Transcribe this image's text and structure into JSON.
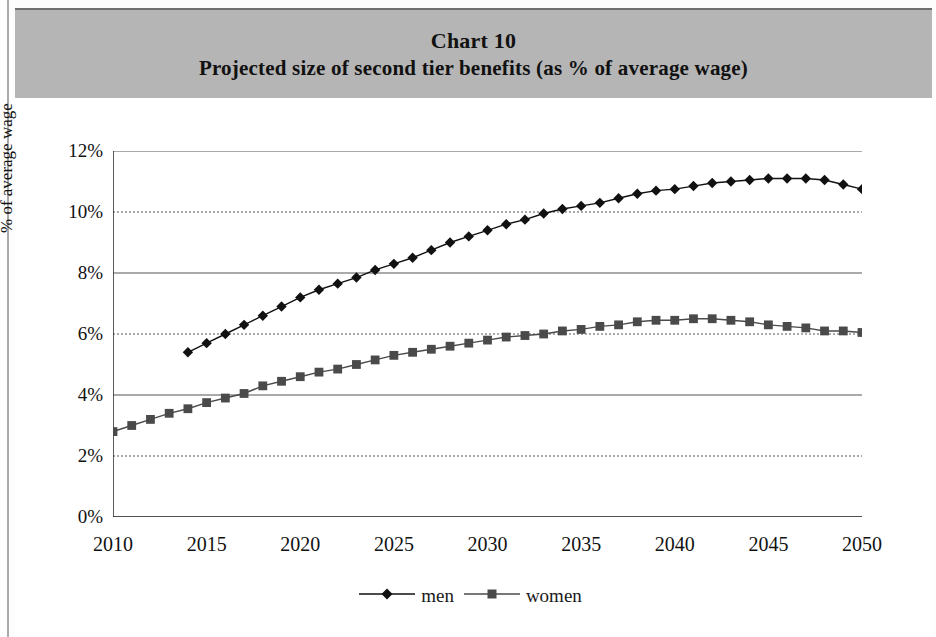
{
  "header": {
    "chart_number": "Chart 10",
    "subtitle": "Projected size of second tier benefits (as % of average wage)"
  },
  "legend": {
    "position": "bottom-center",
    "entries": [
      {
        "label": "men",
        "marker": "diamond",
        "color": "#111111"
      },
      {
        "label": "women",
        "marker": "square",
        "color": "#4a4a4a"
      }
    ]
  },
  "axes": {
    "y_title": "% of average wage",
    "y_ticks": [
      "0%",
      "2%",
      "4%",
      "6%",
      "8%",
      "10%",
      "12%"
    ],
    "x_ticks": [
      "2010",
      "2015",
      "2020",
      "2025",
      "2030",
      "2035",
      "2040",
      "2045",
      "2050"
    ]
  },
  "chart_data": {
    "type": "line",
    "title": "Chart 10",
    "subtitle": "Projected size of second tier benefits (as % of average wage)",
    "xlabel": "",
    "ylabel": "% of average wage",
    "xlim": [
      2010,
      2050
    ],
    "ylim": [
      0,
      12
    ],
    "y_tick_values": [
      0,
      2,
      4,
      6,
      8,
      10,
      12
    ],
    "y_tick_labels": [
      "0%",
      "2%",
      "4%",
      "6%",
      "8%",
      "10%",
      "12%"
    ],
    "x_tick_values": [
      2010,
      2015,
      2020,
      2025,
      2030,
      2035,
      2040,
      2045,
      2050
    ],
    "x_minor_tick_step": 1,
    "grid": true,
    "grid_axis": "y",
    "units": "percent of average wage",
    "series": [
      {
        "name": "men",
        "marker": "diamond",
        "color": "#111111",
        "x": [
          2014,
          2015,
          2016,
          2017,
          2018,
          2019,
          2020,
          2021,
          2022,
          2023,
          2024,
          2025,
          2026,
          2027,
          2028,
          2029,
          2030,
          2031,
          2032,
          2033,
          2034,
          2035,
          2036,
          2037,
          2038,
          2039,
          2040,
          2041,
          2042,
          2043,
          2044,
          2045,
          2046,
          2047,
          2048,
          2049,
          2050
        ],
        "values": [
          5.4,
          5.7,
          6.0,
          6.3,
          6.6,
          6.9,
          7.2,
          7.45,
          7.65,
          7.85,
          8.1,
          8.3,
          8.5,
          8.75,
          9.0,
          9.2,
          9.4,
          9.6,
          9.75,
          9.95,
          10.1,
          10.2,
          10.3,
          10.45,
          10.6,
          10.7,
          10.75,
          10.85,
          10.95,
          11.0,
          11.05,
          11.1,
          11.1,
          11.1,
          11.05,
          10.9,
          10.75
        ]
      },
      {
        "name": "women",
        "marker": "square",
        "color": "#4a4a4a",
        "x": [
          2010,
          2011,
          2012,
          2013,
          2014,
          2015,
          2016,
          2017,
          2018,
          2019,
          2020,
          2021,
          2022,
          2023,
          2024,
          2025,
          2026,
          2027,
          2028,
          2029,
          2030,
          2031,
          2032,
          2033,
          2034,
          2035,
          2036,
          2037,
          2038,
          2039,
          2040,
          2041,
          2042,
          2043,
          2044,
          2045,
          2046,
          2047,
          2048,
          2049,
          2050
        ],
        "values": [
          2.8,
          3.0,
          3.2,
          3.4,
          3.55,
          3.75,
          3.9,
          4.05,
          4.3,
          4.45,
          4.6,
          4.75,
          4.85,
          5.0,
          5.15,
          5.3,
          5.4,
          5.5,
          5.6,
          5.7,
          5.8,
          5.9,
          5.95,
          6.0,
          6.1,
          6.15,
          6.25,
          6.3,
          6.4,
          6.45,
          6.45,
          6.5,
          6.5,
          6.45,
          6.4,
          6.3,
          6.25,
          6.2,
          6.1,
          6.1,
          6.05
        ]
      }
    ]
  }
}
